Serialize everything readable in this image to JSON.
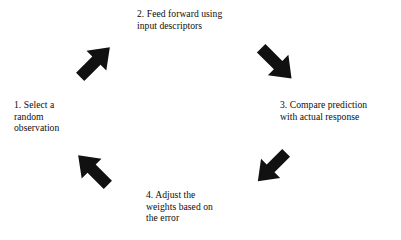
{
  "diagram": {
    "type": "cycle-diagram",
    "background_color": "#ffffff",
    "text_color": "#0d0d0d",
    "arrow_color": "#111111",
    "steps": [
      {
        "number": "1",
        "id": "select-random-observation",
        "text": "1. Select a\nrandom\nobservation",
        "position": "left"
      },
      {
        "number": "2",
        "id": "feed-forward",
        "text": "2. Feed forward using\ninput descriptors",
        "position": "top"
      },
      {
        "number": "3",
        "id": "compare-prediction",
        "text": "3. Compare prediction\nwith actual response",
        "position": "right"
      },
      {
        "number": "4",
        "id": "adjust-weights",
        "text": "4. Adjust the\nweights based on\nthe error",
        "position": "bottom"
      }
    ],
    "arrows": [
      {
        "id": "arrow-1-to-2",
        "from": "1",
        "to": "2",
        "direction": "up-right",
        "icon": "arrow-up-right-icon"
      },
      {
        "id": "arrow-2-to-3",
        "from": "2",
        "to": "3",
        "direction": "down-right",
        "icon": "arrow-down-right-icon"
      },
      {
        "id": "arrow-3-to-4",
        "from": "3",
        "to": "4",
        "direction": "down-left",
        "icon": "arrow-down-left-icon"
      },
      {
        "id": "arrow-4-to-1",
        "from": "4",
        "to": "1",
        "direction": "up-left",
        "icon": "arrow-up-left-icon"
      }
    ]
  }
}
